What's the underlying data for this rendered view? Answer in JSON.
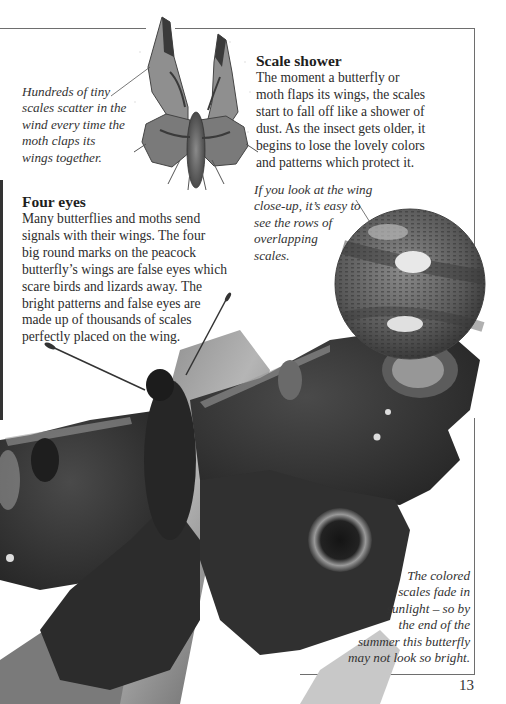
{
  "moth_caption": {
    "lines": [
      "Hundreds of tiny",
      "scales scatter in the",
      "wind every time the",
      "moth claps its",
      "wings together."
    ]
  },
  "scale_shower": {
    "heading": "Scale shower",
    "lines": [
      "The moment a butterfly or",
      "moth flaps its wings, the scales",
      "start to fall off like a shower of",
      "dust. As the insect gets older, it",
      "begins to lose the lovely colors",
      "and patterns which protect it."
    ]
  },
  "closeup_caption": {
    "lines": [
      "If you look at the wing",
      "close-up, it’s easy to",
      "see the rows of",
      "overlapping",
      "scales."
    ]
  },
  "four_eyes": {
    "heading": "Four eyes",
    "lines": [
      "Many butterflies and moths send",
      "signals with their wings. The four",
      "big round marks on the peacock",
      "butterfly’s wings are false eyes which",
      "scare birds and lizards away. The",
      "bright patterns and false eyes are",
      "made up of thousands of scales",
      "perfectly placed on the wing."
    ]
  },
  "fade_caption": {
    "lines": [
      "The colored",
      "scales fade in",
      "sunlight – so by",
      "the end of the",
      "summer this butterfly",
      "may not look so bright."
    ]
  },
  "page_number": "13",
  "images": {
    "moth": "angle-shades-moth-illustration",
    "magnifier": "wing-scales-closeup",
    "butterfly": "peacock-butterfly-photo"
  }
}
